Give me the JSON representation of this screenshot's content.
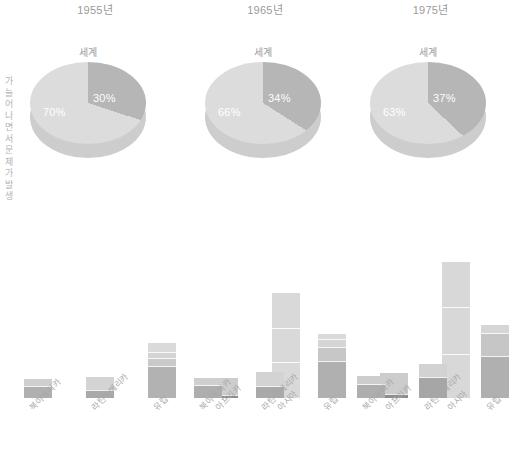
{
  "side_caption": {
    "text": "가 늘 어 나 면 서 문 제 가 발 생"
  },
  "chart_data": {
    "type": "pie+bar",
    "title": "",
    "panels": [
      {
        "year_label": "1955년",
        "pie": {
          "title": "세계",
          "type": "pie",
          "labels": [
            "도시 인구",
            "농촌 인구"
          ],
          "values": [
            30,
            70
          ],
          "value_labels": [
            "30%",
            "70%"
          ],
          "colors": [
            "#b6b6b6",
            "#dcdcdc"
          ]
        },
        "bar": {
          "type": "bar",
          "categories": [
            "북아메리카",
            "라틴아메리카",
            "유럽",
            "아프리카",
            "아시아"
          ],
          "values": [
            18,
            20,
            52,
            19,
            100
          ],
          "segments": [
            [
              11,
              7
            ],
            [
              8,
              12
            ],
            [
              30,
              8,
              6,
              8
            ],
            [
              3,
              16
            ],
            [
              34,
              33,
              33
            ]
          ],
          "segment_colors": [
            [
              "#b0b0b0",
              "#cfcfcf"
            ],
            [
              "#a9a9a9",
              "#d4d4d4"
            ],
            [
              "#b2b2b2",
              "#c9c9c9",
              "#d4d4d4",
              "#dadada"
            ],
            [
              "#8d8d8d",
              "#cdcdcd"
            ],
            [
              "#d9d9d9",
              "#d9d9d9",
              "#d9d9d9"
            ]
          ]
        }
      },
      {
        "year_label": "1965년",
        "pie": {
          "title": "세계",
          "type": "pie",
          "labels": [
            "도시 인구",
            "농촌 인구"
          ],
          "values": [
            34,
            66
          ],
          "value_labels": [
            "34%",
            "66%"
          ],
          "colors": [
            "#b6b6b6",
            "#dcdcdc"
          ]
        },
        "bar": {
          "type": "bar",
          "categories": [
            "북아메리카",
            "라틴아메리카",
            "유럽",
            "아프리카",
            "아시아"
          ],
          "values": [
            19,
            25,
            61,
            24,
            130
          ],
          "segments": [
            [
              12,
              7
            ],
            [
              11,
              14
            ],
            [
              35,
              14,
              7,
              5
            ],
            [
              4,
              20
            ],
            [
              42,
              45,
              43
            ]
          ],
          "segment_colors": [
            [
              "#aeaeae",
              "#cfcfcf"
            ],
            [
              "#a9a9a9",
              "#d3d3d3"
            ],
            [
              "#b0b0b0",
              "#c7c7c7",
              "#d5d5d5",
              "#dadada"
            ],
            [
              "#8d8d8d",
              "#cccccc"
            ],
            [
              "#d8d8d8",
              "#d8d8d8",
              "#d8d8d8"
            ]
          ]
        }
      },
      {
        "year_label": "1975년",
        "pie": {
          "title": "세계",
          "type": "pie",
          "labels": [
            "도시 인구",
            "농촌 인구"
          ],
          "values": [
            37,
            63
          ],
          "value_labels": [
            "37%",
            "63%"
          ],
          "colors": [
            "#b6b6b6",
            "#dcdcdc"
          ]
        },
        "bar": {
          "type": "bar",
          "categories": [
            "북아메리카",
            "라틴아메리카",
            "유럽",
            "아프리카",
            "아시아"
          ],
          "values": [
            21,
            32,
            70,
            34,
            182
          ],
          "segments": [
            [
              13,
              8
            ],
            [
              20,
              12
            ],
            [
              40,
              22,
              8
            ],
            [
              9,
              25
            ],
            [
              60,
              62,
              60
            ]
          ],
          "segment_colors": [
            [
              "#aeaeae",
              "#cdcdcd"
            ],
            [
              "#a6a6a6",
              "#d2d2d2"
            ],
            [
              "#b0b0b0",
              "#c6c6c6",
              "#d6d6d6"
            ],
            [
              "#838383",
              "#cbcbcb"
            ],
            [
              "#d7d7d7",
              "#d7d7d7",
              "#d7d7d7"
            ]
          ]
        }
      }
    ],
    "ylabel": "",
    "xlabel": "",
    "grid": false,
    "legend": "none"
  },
  "colors": {
    "background": "#ffffff",
    "text": "#9a9a9a",
    "pie_dark": "#b6b6b6",
    "pie_light": "#dcdcdc"
  }
}
